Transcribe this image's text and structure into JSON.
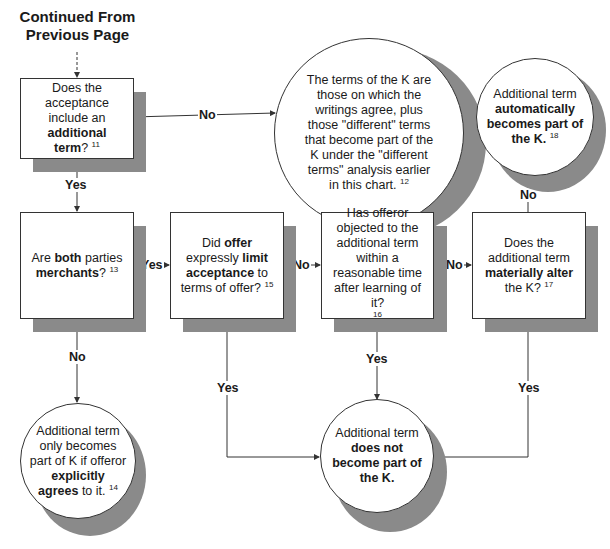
{
  "header": {
    "continued_line1": "Continued From",
    "continued_line2": "Previous Page"
  },
  "nodes": {
    "q_additional_term": {
      "pre": "Does the acceptance include an ",
      "bold": "additional",
      "post_bold": "term",
      "post": "?",
      "note": "11"
    },
    "r_terms_of_k": {
      "text": "The terms of the K are those on which the writings agree, plus those \"different\" terms that become part of the K under the \"different terms\" analysis earlier in this chart.",
      "note": "12"
    },
    "r_automatically": {
      "pre": "Additional term ",
      "bold": "automatically becomes part of the K.",
      "note": "18"
    },
    "q_merchants": {
      "pre": "Are ",
      "bold1": "both",
      "mid": " parties ",
      "bold2": "merchants",
      "post": "?",
      "note": "13"
    },
    "q_limit_acceptance": {
      "pre": "Did ",
      "bold1": "offer",
      "mid": " expressly ",
      "bold2": "limit acceptance",
      "post": " to terms of offer?",
      "note": "15"
    },
    "q_objected": {
      "text": "Has offeror objected to the additional term within a reasonable time after learning of it?",
      "note": "16"
    },
    "q_materially_alter": {
      "pre": "Does the additional term ",
      "bold": "materially alter",
      "post": " the K?",
      "note": "17"
    },
    "r_explicitly_agrees": {
      "pre": "Additional term only becomes part of K if offeror ",
      "bold1": "explicitly",
      "bold2": "agrees",
      "post": " to it.",
      "note": "14"
    },
    "r_not_part": {
      "pre": "Additional term ",
      "bold": "does not become part of the K."
    }
  },
  "edges": {
    "q1_no": "No",
    "q1_yes": "Yes",
    "merchants_yes": "Yes",
    "merchants_no": "No",
    "limit_no": "No",
    "limit_yes": "Yes",
    "objected_no": "No",
    "objected_yes": "Yes",
    "alter_no": "No",
    "alter_yes": "Yes"
  },
  "colors": {
    "shadow": "#8a8a8a",
    "line": "#333333",
    "background": "#ffffff"
  }
}
